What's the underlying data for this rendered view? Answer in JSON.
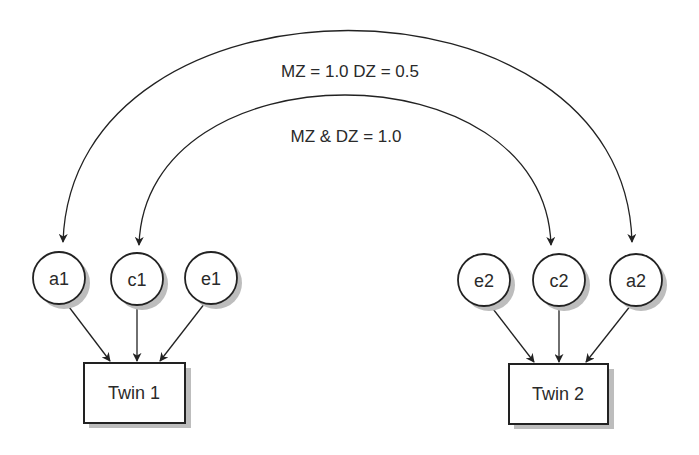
{
  "diagram": {
    "type": "twin-ace-path-model",
    "correlations": {
      "additive_genetic": {
        "label": "MZ = 1.0  DZ = 0.5",
        "from": "a1",
        "to": "a2"
      },
      "common_environment": {
        "label": "MZ & DZ = 1.0",
        "from": "c1",
        "to": "c2"
      }
    },
    "twin1": {
      "box_label": "Twin 1",
      "latent_factors": [
        {
          "id": "a1",
          "label": "a1"
        },
        {
          "id": "c1",
          "label": "c1"
        },
        {
          "id": "e1",
          "label": "e1"
        }
      ]
    },
    "twin2": {
      "box_label": "Twin 2",
      "latent_factors": [
        {
          "id": "e2",
          "label": "e2"
        },
        {
          "id": "c2",
          "label": "c2"
        },
        {
          "id": "a2",
          "label": "a2"
        }
      ]
    },
    "colors": {
      "stroke": "#222222",
      "shadow": "#bdbdbd",
      "background": "#ffffff",
      "text": "#2a2a2a"
    }
  }
}
